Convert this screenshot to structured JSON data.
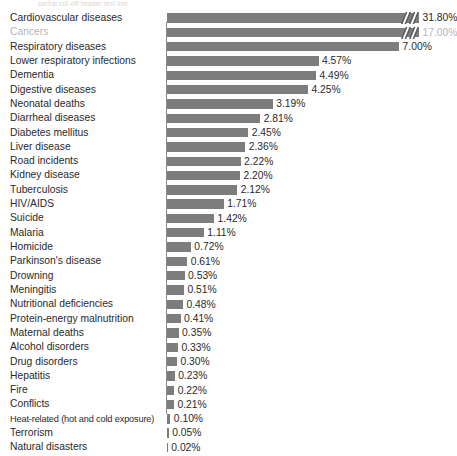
{
  "top_cut_text": "partial cut-off header text line",
  "chart_data": {
    "type": "bar",
    "orientation": "horizontal",
    "title": "",
    "subtitle": "",
    "xlabel": "",
    "ylabel": "",
    "grid": false,
    "legend": null,
    "axis_break": {
      "enabled": true,
      "applies_to": [
        "Cardiovascular diseases",
        "Cancers"
      ],
      "note": "bars truncated with a double-slash break marker"
    },
    "xlim": [
      0,
      7.6
    ],
    "value_suffix": "%",
    "bar_color": "#7d7d7d",
    "categories": [
      "Cardiovascular diseases",
      "Cancers",
      "Respiratory diseases",
      "Lower respiratory infections",
      "Dementia",
      "Digestive diseases",
      "Neonatal deaths",
      "Diarrheal diseases",
      "Diabetes mellitus",
      "Liver disease",
      "Road incidents",
      "Kidney disease",
      "Tuberculosis",
      "HIV/AIDS",
      "Suicide",
      "Malaria",
      "Homicide",
      "Parkinson's disease",
      "Drowning",
      "Meningitis",
      "Nutritional deficiencies",
      "Protein-energy malnutrition",
      "Maternal deaths",
      "Alcohol disorders",
      "Drug disorders",
      "Hepatitis",
      "Fire",
      "Conflicts",
      "Heat-related (hot and cold exposure)",
      "Terrorism",
      "Natural disasters"
    ],
    "values": [
      31.8,
      17.0,
      7.0,
      4.57,
      4.49,
      4.25,
      3.19,
      2.81,
      2.45,
      2.36,
      2.22,
      2.2,
      2.12,
      1.71,
      1.42,
      1.11,
      0.72,
      0.61,
      0.53,
      0.51,
      0.48,
      0.41,
      0.35,
      0.33,
      0.3,
      0.23,
      0.22,
      0.21,
      0.1,
      0.05,
      0.02
    ],
    "value_labels": [
      "31.80%",
      "17.00%",
      "7.00%",
      "4.57%",
      "4.49%",
      "4.25%",
      "3.19%",
      "2.81%",
      "2.45%",
      "2.36%",
      "2.22%",
      "2.20%",
      "2.12%",
      "1.71%",
      "1.42%",
      "1.11%",
      "0.72%",
      "0.61%",
      "0.53%",
      "0.51%",
      "0.48%",
      "0.41%",
      "0.35%",
      "0.33%",
      "0.30%",
      "0.23%",
      "0.22%",
      "0.21%",
      "0.10%",
      "0.05%",
      "0.02%"
    ]
  }
}
